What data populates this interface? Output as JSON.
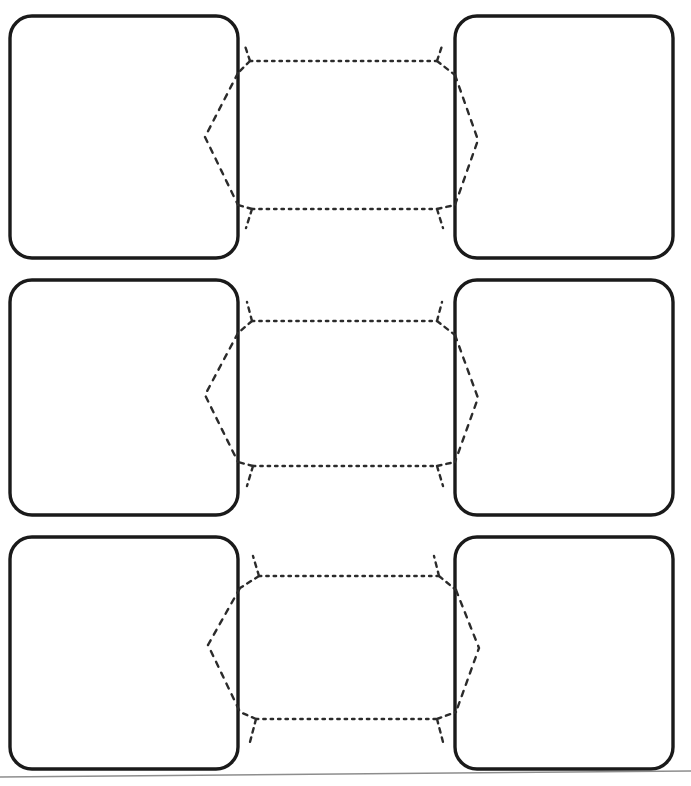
{
  "page": {
    "background_color": "#ffffff",
    "width": 691,
    "height": 786,
    "ink_color": "#1a1a1a",
    "connector_color": "#2b2b2b",
    "rule_color": "#8d8d8d"
  },
  "boxes": [
    {
      "id": "row1-left",
      "label": "",
      "row": 1,
      "column": "left",
      "x": 10,
      "y": 16,
      "width": 228,
      "height": 242,
      "corner_radius": 22
    },
    {
      "id": "row1-right",
      "label": "",
      "row": 1,
      "column": "right",
      "x": 455,
      "y": 16,
      "width": 218,
      "height": 242,
      "corner_radius": 22
    },
    {
      "id": "row2-left",
      "label": "",
      "row": 2,
      "column": "left",
      "x": 10,
      "y": 280,
      "width": 228,
      "height": 235,
      "corner_radius": 22
    },
    {
      "id": "row2-right",
      "label": "",
      "row": 2,
      "column": "right",
      "x": 455,
      "y": 280,
      "width": 218,
      "height": 235,
      "corner_radius": 22
    },
    {
      "id": "row3-left",
      "label": "",
      "row": 3,
      "column": "left",
      "x": 10,
      "y": 537,
      "width": 228,
      "height": 232,
      "corner_radius": 22
    },
    {
      "id": "row3-right",
      "label": "",
      "row": 3,
      "column": "right",
      "x": 455,
      "y": 537,
      "width": 218,
      "height": 232,
      "corner_radius": 22
    }
  ],
  "connectors": [
    {
      "id": "row1-top",
      "row": 1,
      "position": "top",
      "style": "dotted",
      "direction": "bidirectional",
      "from": "row1-right",
      "to": "row1-left",
      "label": ""
    },
    {
      "id": "row1-bottom",
      "row": 1,
      "position": "bottom",
      "style": "dotted",
      "direction": "bidirectional",
      "from": "row1-left",
      "to": "row1-right",
      "label": ""
    },
    {
      "id": "row1-bulge-left",
      "row": 1,
      "position": "left-curve",
      "style": "dashed",
      "direction": "none",
      "label": ""
    },
    {
      "id": "row1-bulge-right",
      "row": 1,
      "position": "right-curve",
      "style": "dashed",
      "direction": "none",
      "label": ""
    },
    {
      "id": "row2-top",
      "row": 2,
      "position": "top",
      "style": "dotted",
      "direction": "bidirectional",
      "from": "row2-right",
      "to": "row2-left",
      "label": ""
    },
    {
      "id": "row2-bottom",
      "row": 2,
      "position": "bottom",
      "style": "dotted",
      "direction": "bidirectional",
      "from": "row2-left",
      "to": "row2-right",
      "label": ""
    },
    {
      "id": "row2-bulge-left",
      "row": 2,
      "position": "left-curve",
      "style": "dashed",
      "direction": "none",
      "label": ""
    },
    {
      "id": "row2-bulge-right",
      "row": 2,
      "position": "right-curve",
      "style": "dashed",
      "direction": "none",
      "label": ""
    },
    {
      "id": "row3-top",
      "row": 3,
      "position": "top",
      "style": "dotted",
      "direction": "bidirectional",
      "from": "row3-right",
      "to": "row3-left",
      "label": ""
    },
    {
      "id": "row3-bottom",
      "row": 3,
      "position": "bottom",
      "style": "dotted",
      "direction": "bidirectional",
      "from": "row3-left",
      "to": "row3-right",
      "label": ""
    },
    {
      "id": "row3-bulge-left",
      "row": 3,
      "position": "left-curve",
      "style": "dashed",
      "direction": "none",
      "label": ""
    },
    {
      "id": "row3-bulge-right",
      "row": 3,
      "position": "right-curve",
      "style": "dashed",
      "direction": "none",
      "label": ""
    }
  ],
  "footer": {
    "rule_present": true,
    "rule_y_left": 777,
    "rule_y_right": 771
  }
}
